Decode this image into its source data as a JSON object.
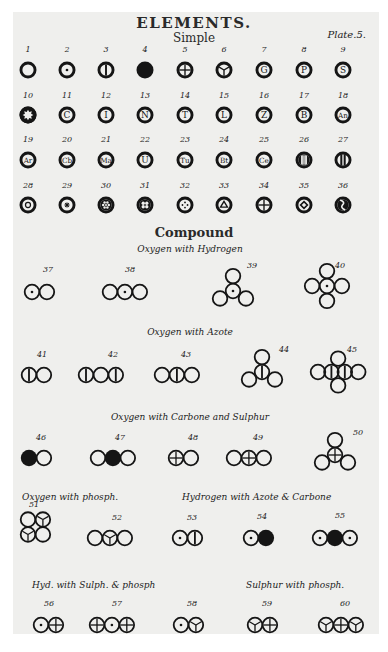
{
  "header": {
    "title": "ELEMENTS.",
    "subtitle": "Simple",
    "plate_label": "Plate.5."
  },
  "simple_elements": [
    {
      "n": "1",
      "glyph": "empty"
    },
    {
      "n": "2",
      "glyph": "dot"
    },
    {
      "n": "3",
      "glyph": "vbar"
    },
    {
      "n": "4",
      "glyph": "filled"
    },
    {
      "n": "5",
      "glyph": "cross"
    },
    {
      "n": "6",
      "glyph": "tri-spoke"
    },
    {
      "n": "7",
      "glyph": "letter",
      "letter": "G"
    },
    {
      "n": "8",
      "glyph": "letter",
      "letter": "P"
    },
    {
      "n": "9",
      "glyph": "letter",
      "letter": "S"
    },
    {
      "n": "10",
      "glyph": "star"
    },
    {
      "n": "11",
      "glyph": "letter",
      "letter": "C"
    },
    {
      "n": "12",
      "glyph": "letter",
      "letter": "I"
    },
    {
      "n": "13",
      "glyph": "letter",
      "letter": "N"
    },
    {
      "n": "14",
      "glyph": "letter",
      "letter": "T"
    },
    {
      "n": "15",
      "glyph": "letter",
      "letter": "L"
    },
    {
      "n": "16",
      "glyph": "letter",
      "letter": "Z"
    },
    {
      "n": "17",
      "glyph": "letter",
      "letter": "B"
    },
    {
      "n": "18",
      "glyph": "letter",
      "letter": "An"
    },
    {
      "n": "19",
      "glyph": "letter",
      "letter": "Ar"
    },
    {
      "n": "20",
      "glyph": "letter",
      "letter": "Cb"
    },
    {
      "n": "21",
      "glyph": "letter",
      "letter": "Ma"
    },
    {
      "n": "22",
      "glyph": "letter",
      "letter": "U"
    },
    {
      "n": "23",
      "glyph": "letter",
      "letter": "Tu"
    },
    {
      "n": "24",
      "glyph": "letter",
      "letter": "Bt"
    },
    {
      "n": "25",
      "glyph": "letter",
      "letter": "Ce"
    },
    {
      "n": "26",
      "glyph": "three-bars"
    },
    {
      "n": "27",
      "glyph": "two-bars"
    },
    {
      "n": "28",
      "glyph": "ring"
    },
    {
      "n": "29",
      "glyph": "asterisk"
    },
    {
      "n": "30",
      "glyph": "flower"
    },
    {
      "n": "31",
      "glyph": "four-lobes"
    },
    {
      "n": "32",
      "glyph": "four-dots"
    },
    {
      "n": "33",
      "glyph": "triangle"
    },
    {
      "n": "34",
      "glyph": "cross-small"
    },
    {
      "n": "35",
      "glyph": "diamond"
    },
    {
      "n": "36",
      "glyph": "zigzag"
    }
  ],
  "compound_heading": "Compound",
  "groups": [
    {
      "label": "Oxygen  with Hydrogen"
    },
    {
      "label": "Oxygen  with Azote"
    },
    {
      "label": "Oxygen with Carbone  and Sulphur"
    },
    {
      "label": "Oxygen with phosph."
    },
    {
      "label": "Hydrogen with Azote & Carbone"
    },
    {
      "label": "Hyd. with Sulph. & phosph"
    },
    {
      "label": "Sulphur with phosph."
    }
  ],
  "compounds": [
    {
      "n": "37",
      "atoms": [
        "dot",
        "empty"
      ],
      "layout": "row"
    },
    {
      "n": "38",
      "atoms": [
        "empty",
        "dot",
        "empty"
      ],
      "layout": "row"
    },
    {
      "n": "39",
      "atoms": [
        "dot",
        "empty",
        "empty",
        "empty"
      ],
      "layout": "tri"
    },
    {
      "n": "40",
      "atoms": [
        "dot",
        "empty",
        "empty",
        "empty",
        "empty"
      ],
      "layout": "plus"
    },
    {
      "n": "41",
      "atoms": [
        "vbar",
        "empty"
      ],
      "layout": "row"
    },
    {
      "n": "42",
      "atoms": [
        "vbar",
        "empty",
        "vbar"
      ],
      "layout": "row"
    },
    {
      "n": "43",
      "atoms": [
        "empty",
        "vbar",
        "empty"
      ],
      "layout": "row"
    },
    {
      "n": "44",
      "atoms": [
        "vbar",
        "empty",
        "empty",
        "empty"
      ],
      "layout": "tri"
    },
    {
      "n": "45",
      "atoms": [
        "empty",
        "vbar",
        "empty",
        "vbar",
        "empty"
      ],
      "layout": "plus2"
    },
    {
      "n": "46",
      "atoms": [
        "filled",
        "empty"
      ],
      "layout": "row"
    },
    {
      "n": "47",
      "atoms": [
        "empty",
        "filled",
        "empty"
      ],
      "layout": "row"
    },
    {
      "n": "48",
      "atoms": [
        "cross",
        "empty"
      ],
      "layout": "row"
    },
    {
      "n": "49",
      "atoms": [
        "empty",
        "cross",
        "empty"
      ],
      "layout": "row"
    },
    {
      "n": "50",
      "atoms": [
        "cross",
        "empty",
        "empty",
        "empty"
      ],
      "layout": "tri"
    },
    {
      "n": "51",
      "atoms": [
        "empty",
        "tri-spoke",
        "tri-spoke",
        "empty"
      ],
      "layout": "square"
    },
    {
      "n": "52",
      "atoms": [
        "empty",
        "tri-spoke",
        "empty"
      ],
      "layout": "row"
    },
    {
      "n": "53",
      "atoms": [
        "dot",
        "vbar"
      ],
      "layout": "row"
    },
    {
      "n": "54",
      "atoms": [
        "dot",
        "filled"
      ],
      "layout": "row"
    },
    {
      "n": "55",
      "atoms": [
        "dot",
        "filled",
        "dot"
      ],
      "layout": "row"
    },
    {
      "n": "56",
      "atoms": [
        "dot",
        "cross"
      ],
      "layout": "row"
    },
    {
      "n": "57",
      "atoms": [
        "cross",
        "dot",
        "cross"
      ],
      "layout": "row"
    },
    {
      "n": "58",
      "atoms": [
        "dot",
        "tri-spoke"
      ],
      "layout": "row"
    },
    {
      "n": "59",
      "atoms": [
        "tri-spoke",
        "cross"
      ],
      "layout": "row"
    },
    {
      "n": "60",
      "atoms": [
        "tri-spoke",
        "cross",
        "tri-spoke"
      ],
      "layout": "row"
    }
  ]
}
